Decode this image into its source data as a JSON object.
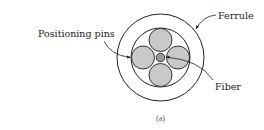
{
  "figure": {
    "caption": "(a)",
    "labels": {
      "ferrule": "Ferrule",
      "positioning_pins": "Positioning pins",
      "fiber": "Fiber"
    },
    "colors": {
      "stroke": "#222222",
      "pin_fill": "#c9c9c9",
      "fiber_fill": "#9a9a9a",
      "background": "#ffffff"
    },
    "geometry": {
      "ferrule_outer": {
        "cx": 160.5,
        "cy": 57.5,
        "r": 43.5
      },
      "ferrule_bore": {
        "cx": 160.5,
        "cy": 57.5,
        "r": 29.5
      },
      "pins": [
        {
          "name": "top",
          "cx": 160.5,
          "cy": 40,
          "r": 11.5
        },
        {
          "name": "bottom",
          "cx": 160.5,
          "cy": 75,
          "r": 11.5
        },
        {
          "name": "left",
          "cx": 143,
          "cy": 57.5,
          "r": 11.5
        },
        {
          "name": "right",
          "cx": 178,
          "cy": 57.5,
          "r": 11.5
        }
      ],
      "fiber": {
        "cx": 160.5,
        "cy": 57.5,
        "r": 4.3
      }
    }
  }
}
